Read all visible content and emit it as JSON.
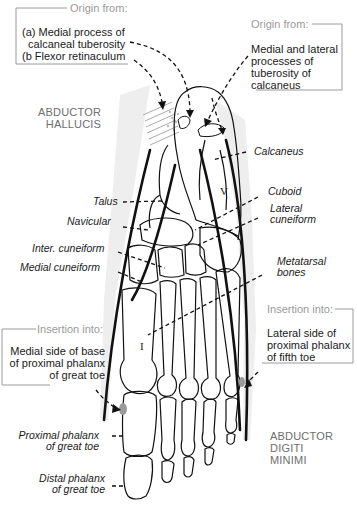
{
  "diagram": {
    "muscles": {
      "abductor_hallucis": "ABDUCTOR\nHALLUCIS",
      "abductor_digiti_minimi": "ABDUCTOR\nDIGITI\nMINIMI"
    },
    "boxes": {
      "origin_left": {
        "title": "Origin from:",
        "text": "(a) Medial process of\n  calcaneal tuberosity\n(b Flexor retinaculum"
      },
      "origin_right": {
        "title": "Origin from:",
        "text": "Medial and lateral\nprocesses of\ntuberosity of\ncalcaneus"
      },
      "insertion_left": {
        "title": "Insertion into:",
        "text": "Medial side of base\nof proximal phalanx\nof great toe"
      },
      "insertion_right": {
        "title": "Insertion into:",
        "text": "Lateral side of\nproximal phalanx\nof fifth toe"
      }
    },
    "bone_labels": {
      "talus": "Talus",
      "navicular": "Navicular",
      "inter_cuneiform": "Inter. cuneiform",
      "medial_cuneiform": "Medial cuneiform",
      "calcaneus": "Calcaneus",
      "cuboid": "Cuboid",
      "lateral_cuneiform": "Lateral\ncuneiform",
      "metatarsal_bones": "Metatarsal\nbones",
      "proximal_phalanx_great_toe": "Proximal phalanx\nof great toe",
      "distal_phalanx_great_toe": "Distal phalanx\nof great toe"
    },
    "roman_numerals": {
      "first": "I",
      "fifth": "V"
    },
    "colors": {
      "line": "#111111",
      "box_border": "#9a9a9a",
      "muscle_shade": "#ececec",
      "attachment": "#9a9a9a"
    }
  }
}
